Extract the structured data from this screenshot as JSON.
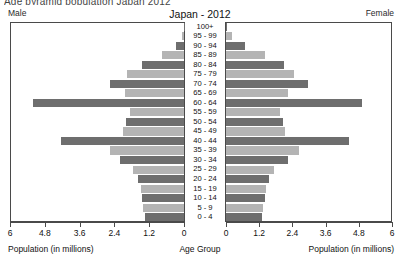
{
  "clipped_header": "Age pyramid population Japan 2012",
  "header": {
    "male_label": "Male",
    "female_label": "Female",
    "title": "Japan - 2012"
  },
  "axis": {
    "left_ticks": [
      "6",
      "4.8",
      "3.6",
      "2.4",
      "1.2",
      "0"
    ],
    "right_ticks": [
      "0",
      "1.2",
      "2.4",
      "3.6",
      "4.8",
      "6"
    ],
    "left_caption": "Population (in millions)",
    "center_caption": "Age Group",
    "right_caption": "Population (in millions)"
  },
  "colors": {
    "bar_dark": "#6e6e6e",
    "bar_light": "#b4b4b4",
    "frame": "#4a4a4a",
    "background": "#ffffff"
  },
  "chart_data": {
    "type": "bar",
    "title": "Japan - 2012",
    "subtype": "population-pyramid",
    "xlabel": "Population (in millions)",
    "ylabel": "Age Group",
    "xlim": [
      0,
      6
    ],
    "xticks": [
      0,
      1.2,
      2.4,
      3.6,
      4.8,
      6
    ],
    "grid": false,
    "legend": [
      "Male",
      "Female"
    ],
    "legend_position": "top-corners",
    "categories": [
      "100+",
      "95 - 99",
      "90 - 94",
      "85 - 89",
      "80 - 84",
      "75 - 79",
      "70 - 74",
      "65 - 69",
      "60 - 64",
      "55 - 59",
      "50 - 54",
      "45 - 49",
      "40 - 44",
      "35 - 39",
      "30 - 34",
      "25 - 29",
      "20 - 24",
      "15 - 19",
      "10 - 14",
      "5 - 9",
      "0 - 4"
    ],
    "series": [
      {
        "name": "Male",
        "side": "left",
        "values": [
          0.01,
          0.07,
          0.29,
          0.75,
          1.45,
          1.95,
          2.55,
          2.05,
          5.2,
          1.85,
          2.0,
          2.1,
          4.25,
          2.55,
          2.2,
          1.75,
          1.6,
          1.5,
          1.45,
          1.4,
          1.35
        ]
      },
      {
        "name": "Female",
        "side": "right",
        "values": [
          0.05,
          0.22,
          0.7,
          1.4,
          2.1,
          2.45,
          2.95,
          2.25,
          4.9,
          1.95,
          2.05,
          2.15,
          4.45,
          2.65,
          2.25,
          1.75,
          1.55,
          1.45,
          1.4,
          1.35,
          1.3
        ]
      }
    ],
    "bar_shades": [
      "dark",
      "light",
      "dark",
      "light",
      "dark",
      "light",
      "dark",
      "light",
      "dark",
      "light",
      "dark",
      "light",
      "dark",
      "light",
      "dark",
      "light",
      "dark",
      "light",
      "dark",
      "light",
      "dark"
    ]
  }
}
